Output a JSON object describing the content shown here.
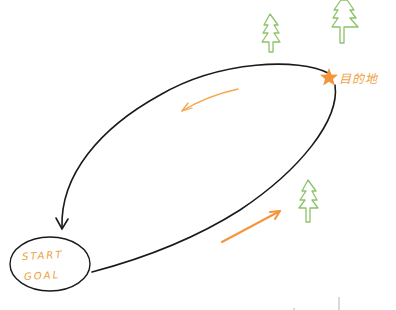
{
  "diagram": {
    "type": "route-loop-sketch",
    "start_node": {
      "label_top": "START",
      "label_bottom": "GOAL"
    },
    "destination": {
      "label": "目的地",
      "marker": "star-icon"
    },
    "arrows": [
      {
        "name": "outbound-direction-arrow",
        "direction": "toward destination"
      },
      {
        "name": "return-direction-arrow",
        "direction": "toward start"
      }
    ],
    "trees": [
      {
        "name": "tree-1"
      },
      {
        "name": "tree-2"
      },
      {
        "name": "tree-3"
      }
    ]
  },
  "colors": {
    "line": "#1a1a1a",
    "accent_orange": "#f5953a",
    "tree_green": "#8cc26a",
    "background": "#ffffff"
  }
}
